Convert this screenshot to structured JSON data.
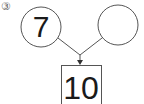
{
  "problem": {
    "marker": "③",
    "left_circle": "7",
    "right_circle": "",
    "total_box": "10"
  },
  "colors": {
    "stroke": "#555555",
    "text": "#1a1a1a"
  }
}
